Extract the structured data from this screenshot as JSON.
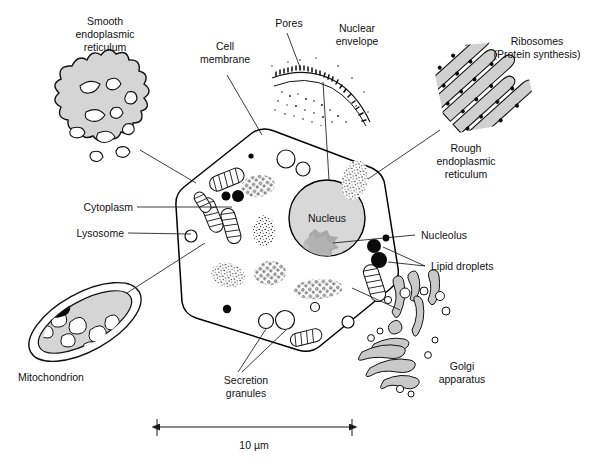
{
  "figure": {
    "background_color": "#ffffff",
    "ink_color": "#111111",
    "fill_gray": "#d5d5d5",
    "nucleus_gray": "#d8d8d8",
    "nucleolus_gray": "#a8a8a8",
    "cytosol_gray": "#fbfbfb"
  },
  "labels": {
    "smooth_er": {
      "line1": "Smooth",
      "line2": "endoplasmic",
      "line3": "reticulum"
    },
    "cell_membrane": {
      "line1": "Cell",
      "line2": "membrane"
    },
    "pores": {
      "line1": "Pores"
    },
    "nuclear_envelope": {
      "line1": "Nuclear",
      "line2": "envelope"
    },
    "ribosomes": {
      "line1": "Ribosomes",
      "line2": "(Protein synthesis)"
    },
    "rough_er": {
      "line1": "Rough",
      "line2": "endoplasmic",
      "line3": "reticulum"
    },
    "cytoplasm": {
      "line1": "Cytoplasm"
    },
    "lysosome": {
      "line1": "Lysosome"
    },
    "nucleus": {
      "line1": "Nucleus"
    },
    "nucleolus": {
      "line1": "Nucleolus"
    },
    "lipid_droplets": {
      "line1": "Lipid droplets"
    },
    "mitochondrion": {
      "line1": "Mitochondrion"
    },
    "secretion_granules": {
      "line1": "Secretion",
      "line2": "granules"
    },
    "golgi": {
      "line1": "Golgi",
      "line2": "apparatus"
    }
  },
  "scale_bar": {
    "value": "10 µm",
    "length_px": 195,
    "x_start": 157,
    "x_end": 352,
    "y": 427
  },
  "structures": {
    "cell": {
      "name": "cell-membrane-outline",
      "shape": "polygon-rounded"
    },
    "nucleus": {
      "name": "nucleus",
      "cx": 327,
      "cy": 218,
      "r": 38
    },
    "nucleolus": {
      "name": "nucleolus",
      "cx": 316,
      "cy": 243
    },
    "mitochondria_count": 6,
    "lysosome_count": 7,
    "lipid_droplet_count": 6,
    "ribosome_cluster_count": 6,
    "secretion_granule_count": 2
  }
}
